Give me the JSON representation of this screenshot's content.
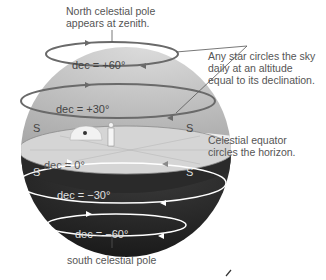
{
  "diagram": {
    "annotations": {
      "north_pole_line1": "North celestial pole",
      "north_pole_line2": "appears at zenith.",
      "stars_line1": "Any star circles the sky",
      "stars_line2": "daily at an altitude",
      "stars_line3": "equal to its declination.",
      "equator_line1": "Celestial equator",
      "equator_line2": "circles the horizon.",
      "south_pole": "south celestial pole"
    },
    "declination_circles": [
      {
        "label": "dec = +60°",
        "dec": 60
      },
      {
        "label": "dec = +30°",
        "dec": 30
      },
      {
        "label": "dec = 0°",
        "dec": 0
      },
      {
        "label": "dec = −30°",
        "dec": -30
      },
      {
        "label": "dec = −60°",
        "dec": -60
      }
    ],
    "horizon_directions": [
      "S",
      "S",
      "S",
      "S"
    ],
    "colors": {
      "sky_upper": "#c9c9c9",
      "sky_lower": "#1e1e1e",
      "horizon_plane": "#d6d6d6",
      "circle_upper": "#6a6a6a",
      "circle_lower": "#ffffff"
    }
  }
}
